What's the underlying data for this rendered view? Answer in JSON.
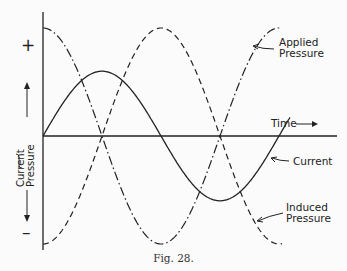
{
  "figure": {
    "caption": "Fig.  28.",
    "y_axis": {
      "plus_label": "+",
      "minus_label": "–",
      "label_line1": "Current",
      "label_line2": "Pressure"
    },
    "x_axis": {
      "label": "Time →"
    },
    "curve_labels": {
      "applied_line1": "Applied",
      "applied_line2": "Pressure",
      "current": "Current",
      "induced_line1": "Induced",
      "induced_line2": "Pressure"
    }
  },
  "chart_data": {
    "type": "line",
    "title": "Fig. 28.",
    "xlabel": "Time",
    "ylabel": "Current / Pressure",
    "series": [
      {
        "name": "Applied Pressure",
        "style": "dash-dot",
        "function": "cos",
        "amplitude": 1.0,
        "phase_deg": 0
      },
      {
        "name": "Induced Pressure",
        "style": "dashed",
        "function": "-cos",
        "amplitude": 1.0,
        "phase_deg": 180
      },
      {
        "name": "Current",
        "style": "solid",
        "function": "sin",
        "amplitude": 0.6,
        "phase_deg": -90
      }
    ],
    "x_range_cycles": [
      0,
      1.05
    ],
    "grid": false,
    "axis_signs": [
      "+",
      "-"
    ]
  }
}
